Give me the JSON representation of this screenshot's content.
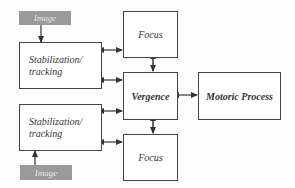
{
  "diagram": {
    "nodes": {
      "image_top": {
        "label": "Image"
      },
      "stab_top": {
        "label_line1": "Stabilization/",
        "label_line2": "tracking"
      },
      "focus_top": {
        "label": "Focus"
      },
      "vergence": {
        "label": "Vergence"
      },
      "motoric": {
        "label": "Motoric Process"
      },
      "stab_bottom": {
        "label_line1": "Stabilization/",
        "label_line2": "tracking"
      },
      "focus_bottom": {
        "label": "Focus"
      },
      "image_bottom": {
        "label": "Image"
      }
    },
    "edges": [
      {
        "from": "image_top",
        "to": "stab_top",
        "style": "solid",
        "direction": "forward"
      },
      {
        "from": "stab_top",
        "to": "focus_top",
        "style": "dashed",
        "direction": "bidirectional"
      },
      {
        "from": "stab_top",
        "to": "vergence",
        "style": "dashed",
        "direction": "bidirectional"
      },
      {
        "from": "focus_top",
        "to": "vergence",
        "style": "solid",
        "direction": "bidirectional"
      },
      {
        "from": "vergence",
        "to": "motoric",
        "style": "solid",
        "direction": "bidirectional"
      },
      {
        "from": "stab_bottom",
        "to": "vergence",
        "style": "dashed",
        "direction": "bidirectional"
      },
      {
        "from": "stab_bottom",
        "to": "focus_bottom",
        "style": "dashed",
        "direction": "bidirectional"
      },
      {
        "from": "vergence",
        "to": "focus_bottom",
        "style": "solid",
        "direction": "bidirectional"
      },
      {
        "from": "image_bottom",
        "to": "stab_bottom",
        "style": "solid",
        "direction": "forward"
      }
    ],
    "colors": {
      "line": "#333333",
      "image_fill": "#9a9a9a",
      "image_text": "#e6e6e6"
    }
  }
}
